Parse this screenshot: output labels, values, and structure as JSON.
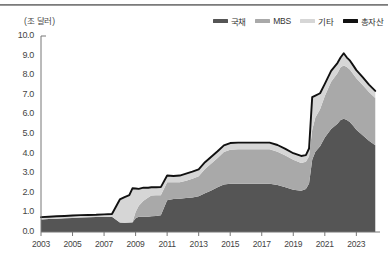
{
  "chart_data": {
    "type": "area",
    "title": "",
    "subtitle": "",
    "unit_label": "(조 달러)",
    "xlabel": "",
    "ylabel": "",
    "ylim": [
      0.0,
      10.0
    ],
    "ytick_step": 1.0,
    "yticks": [
      "10.0",
      "9.0",
      "8.0",
      "7.0",
      "6.0",
      "5.0",
      "4.0",
      "3.0",
      "2.0",
      "1.0",
      "0.0"
    ],
    "xlim": [
      2003,
      2024.5
    ],
    "xticks": [
      "2003",
      "2005",
      "2007",
      "2009",
      "2011",
      "2013",
      "2015",
      "2017",
      "2019",
      "2021",
      "2023"
    ],
    "xtick_values": [
      2003,
      2005,
      2007,
      2009,
      2011,
      2013,
      2015,
      2017,
      2019,
      2021,
      2023
    ],
    "grid": false,
    "legend_position": "top-right",
    "stacked": true,
    "legend": [
      {
        "label": "국채",
        "color": "#555555",
        "kind": "area"
      },
      {
        "label": "MBS",
        "color": "#a9a9a9",
        "kind": "area"
      },
      {
        "label": "기타",
        "color": "#d6d6d6",
        "kind": "area"
      },
      {
        "label": "총자산",
        "color": "#111111",
        "kind": "line"
      }
    ],
    "x": [
      2003.0,
      2003.5,
      2004.0,
      2004.5,
      2005.0,
      2005.5,
      2006.0,
      2006.5,
      2007.0,
      2007.5,
      2008.0,
      2008.3,
      2008.6,
      2008.8,
      2009.0,
      2009.2,
      2009.5,
      2009.8,
      2010.0,
      2010.3,
      2010.6,
      2011.0,
      2011.4,
      2011.8,
      2012.2,
      2012.6,
      2013.0,
      2013.4,
      2013.8,
      2014.2,
      2014.6,
      2015.0,
      2015.5,
      2016.0,
      2016.5,
      2017.0,
      2017.5,
      2018.0,
      2018.5,
      2019.0,
      2019.5,
      2019.8,
      2020.0,
      2020.2,
      2020.4,
      2020.7,
      2021.0,
      2021.4,
      2021.8,
      2022.0,
      2022.2,
      2022.4,
      2022.6,
      2022.8,
      2023.0,
      2023.4,
      2023.8,
      2024.2
    ],
    "series": [
      {
        "name": "국채",
        "color": "#555555",
        "values": [
          0.64,
          0.66,
          0.68,
          0.7,
          0.72,
          0.74,
          0.75,
          0.76,
          0.77,
          0.78,
          0.48,
          0.47,
          0.48,
          0.49,
          0.7,
          0.78,
          0.78,
          0.78,
          0.8,
          0.82,
          0.85,
          1.62,
          1.68,
          1.7,
          1.74,
          1.76,
          1.82,
          1.98,
          2.12,
          2.28,
          2.42,
          2.46,
          2.46,
          2.46,
          2.46,
          2.46,
          2.46,
          2.4,
          2.28,
          2.16,
          2.1,
          2.2,
          2.48,
          3.68,
          4.1,
          4.38,
          4.82,
          5.26,
          5.52,
          5.72,
          5.78,
          5.72,
          5.6,
          5.42,
          5.22,
          4.94,
          4.66,
          4.42
        ]
      },
      {
        "name": "MBS",
        "color": "#a9a9a9",
        "values": [
          0.0,
          0.0,
          0.0,
          0.0,
          0.0,
          0.0,
          0.0,
          0.0,
          0.0,
          0.0,
          0.0,
          0.0,
          0.0,
          0.02,
          0.32,
          0.56,
          0.82,
          0.98,
          1.06,
          1.06,
          1.02,
          0.92,
          0.86,
          0.84,
          0.88,
          0.96,
          1.02,
          1.24,
          1.38,
          1.5,
          1.66,
          1.74,
          1.76,
          1.76,
          1.76,
          1.76,
          1.76,
          1.7,
          1.62,
          1.52,
          1.42,
          1.38,
          1.38,
          1.52,
          1.74,
          1.88,
          2.12,
          2.4,
          2.58,
          2.68,
          2.72,
          2.7,
          2.68,
          2.64,
          2.62,
          2.56,
          2.48,
          2.42
        ]
      },
      {
        "name": "기타",
        "color": "#d6d6d6",
        "values": [
          0.12,
          0.12,
          0.12,
          0.12,
          0.12,
          0.12,
          0.12,
          0.12,
          0.13,
          0.14,
          1.18,
          1.31,
          1.4,
          1.72,
          1.2,
          0.86,
          0.66,
          0.5,
          0.42,
          0.4,
          0.42,
          0.34,
          0.32,
          0.34,
          0.36,
          0.36,
          0.36,
          0.34,
          0.34,
          0.34,
          0.34,
          0.34,
          0.34,
          0.34,
          0.34,
          0.34,
          0.34,
          0.34,
          0.34,
          0.34,
          0.36,
          0.34,
          0.4,
          1.68,
          1.12,
          0.82,
          0.62,
          0.56,
          0.52,
          0.5,
          0.62,
          0.48,
          0.46,
          0.44,
          0.42,
          0.4,
          0.38,
          0.36
        ]
      }
    ],
    "total_line": {
      "name": "총자산",
      "color": "#111111",
      "values": [
        0.76,
        0.78,
        0.8,
        0.82,
        0.84,
        0.86,
        0.87,
        0.88,
        0.9,
        0.92,
        1.66,
        1.78,
        1.88,
        2.23,
        2.22,
        2.2,
        2.26,
        2.26,
        2.28,
        2.28,
        2.29,
        2.88,
        2.86,
        2.88,
        2.98,
        3.08,
        3.2,
        3.56,
        3.84,
        4.12,
        4.42,
        4.54,
        4.56,
        4.56,
        4.56,
        4.56,
        4.56,
        4.44,
        4.24,
        4.02,
        3.88,
        3.92,
        4.26,
        6.88,
        6.96,
        7.08,
        7.56,
        8.22,
        8.62,
        8.9,
        9.12,
        8.9,
        8.74,
        8.5,
        8.26,
        7.9,
        7.52,
        7.2
      ]
    },
    "peak": {
      "year": 2022.2,
      "value": 9.12
    },
    "trough_2019": {
      "year": 2019.5,
      "value": 3.88
    },
    "end_value": 7.2
  }
}
